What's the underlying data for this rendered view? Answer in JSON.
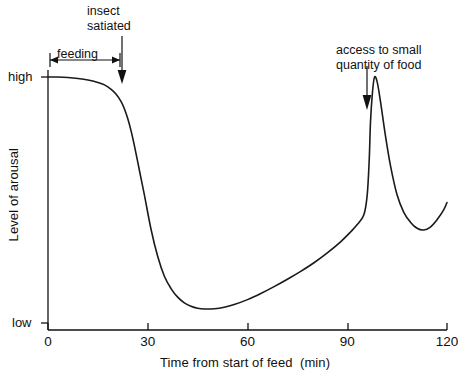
{
  "chart_data": {
    "type": "line",
    "title": "",
    "xlabel": "Time from start of feed  (min)",
    "ylabel": "Level of arousal",
    "xlim": [
      0,
      120
    ],
    "ylim": [
      0,
      1
    ],
    "grid": false,
    "legend": "none",
    "xticks": [
      {
        "value": 0,
        "label": "0"
      },
      {
        "value": 30,
        "label": "30"
      },
      {
        "value": 60,
        "label": "60"
      },
      {
        "value": 90,
        "label": "90"
      },
      {
        "value": 120,
        "label": "120"
      }
    ],
    "yticks": [
      {
        "value": 1,
        "label": "high"
      },
      {
        "value": 0,
        "label": "low"
      }
    ],
    "series": [
      {
        "name": "arousal",
        "x": [
          0,
          3,
          6,
          9,
          12,
          15,
          17,
          19,
          20.5,
          22,
          23,
          24,
          25,
          26,
          27.5,
          29,
          31,
          33,
          35,
          37,
          39,
          41,
          43,
          45,
          47,
          50,
          53,
          56,
          60,
          64,
          68,
          72,
          76,
          80,
          84,
          88,
          91,
          93,
          95,
          96,
          96.6,
          97,
          97.6,
          98.2,
          99,
          100,
          101.5,
          103,
          105,
          107,
          109,
          111,
          113,
          115,
          117,
          119,
          120
        ],
        "y": [
          1.0,
          1.0,
          0.998,
          0.994,
          0.988,
          0.978,
          0.968,
          0.95,
          0.93,
          0.9,
          0.87,
          0.83,
          0.78,
          0.72,
          0.62,
          0.52,
          0.38,
          0.27,
          0.19,
          0.14,
          0.105,
          0.082,
          0.068,
          0.06,
          0.057,
          0.058,
          0.064,
          0.075,
          0.095,
          0.12,
          0.148,
          0.178,
          0.21,
          0.245,
          0.285,
          0.33,
          0.37,
          0.4,
          0.44,
          0.52,
          0.66,
          0.82,
          0.94,
          1.0,
          0.98,
          0.9,
          0.76,
          0.64,
          0.52,
          0.45,
          0.41,
          0.385,
          0.378,
          0.39,
          0.42,
          0.46,
          0.49
        ]
      }
    ],
    "annotations": [
      {
        "id": "insect-satiated",
        "text": "insect\nsatiated",
        "line1": "insect",
        "line2": "satiated",
        "arrow": "down",
        "target_x": 22
      },
      {
        "id": "feeding",
        "text": "feeding",
        "arrow": "double-headed-horizontal",
        "span_x": [
          0,
          22
        ]
      },
      {
        "id": "access-to-food",
        "text": "access to small\nquantity of food",
        "line1": "access to small",
        "line2": "quantity of food",
        "arrow": "down",
        "target_x": 96
      }
    ]
  },
  "axes": {
    "y_title": "Level of arousal",
    "x_title": "Time from start of feed  (min)",
    "y_high_label": "high",
    "y_low_label": "low"
  },
  "annotations": {
    "insect_line1": "insect",
    "insect_line2": "satiated",
    "feeding_label": "feeding",
    "access_line1": "access to small",
    "access_line2": "quantity of food"
  },
  "colors": {
    "ink": "#111111",
    "curve": "#1a1a1a",
    "background": "#ffffff"
  }
}
